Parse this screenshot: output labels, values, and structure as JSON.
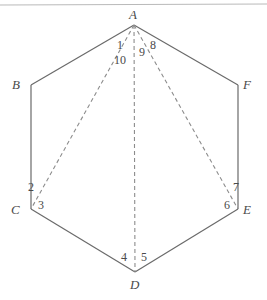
{
  "figure": {
    "shape": "hexagon",
    "colors": {
      "background": "#ffffff",
      "solid_edge": "#6a6a6a",
      "dashed_diagonal": "#8c8c8c",
      "top_rule": "#b9b9b9",
      "label_text": "#4a4a4a"
    },
    "top_rule": {
      "x1": 0,
      "y1": 5,
      "x2": 267,
      "y2": 4
    },
    "vertices": [
      {
        "id": "A",
        "label": "A",
        "x": 134,
        "y": 25,
        "label_x": 129,
        "label_y": 8
      },
      {
        "id": "B",
        "label": "B",
        "x": 31,
        "y": 85,
        "label_x": 12,
        "label_y": 78
      },
      {
        "id": "C",
        "label": "C",
        "x": 31,
        "y": 209,
        "label_x": 11,
        "label_y": 203
      },
      {
        "id": "D",
        "label": "D",
        "x": 135,
        "y": 272,
        "label_x": 130,
        "label_y": 278
      },
      {
        "id": "E",
        "label": "E",
        "x": 238,
        "y": 209,
        "label_x": 243,
        "label_y": 203
      },
      {
        "id": "F",
        "label": "F",
        "x": 238,
        "y": 85,
        "label_x": 243,
        "label_y": 78
      }
    ],
    "edges": [
      {
        "from": "A",
        "to": "B",
        "style": "solid"
      },
      {
        "from": "B",
        "to": "C",
        "style": "solid"
      },
      {
        "from": "C",
        "to": "D",
        "style": "solid"
      },
      {
        "from": "D",
        "to": "E",
        "style": "solid"
      },
      {
        "from": "E",
        "to": "F",
        "style": "solid"
      },
      {
        "from": "F",
        "to": "A",
        "style": "solid"
      }
    ],
    "diagonals": [
      {
        "from": "A",
        "to": "C",
        "style": "dashed"
      },
      {
        "from": "A",
        "to": "D",
        "style": "dashed"
      },
      {
        "from": "A",
        "to": "E",
        "style": "dashed"
      }
    ],
    "angle_labels": [
      {
        "id": "1",
        "text": "1",
        "x": 117,
        "y": 39,
        "at_vertex": "A",
        "between": [
          "AB",
          "AC"
        ]
      },
      {
        "id": "2",
        "text": "2",
        "x": 28,
        "y": 181,
        "at_vertex": "C",
        "between": [
          "CB",
          "CA"
        ]
      },
      {
        "id": "3",
        "text": "3",
        "x": 38,
        "y": 199,
        "at_vertex": "C",
        "between": [
          "CA",
          "CD"
        ]
      },
      {
        "id": "4",
        "text": "4",
        "x": 121,
        "y": 251,
        "at_vertex": "D",
        "between": [
          "DC",
          "DA"
        ]
      },
      {
        "id": "5",
        "text": "5",
        "x": 141,
        "y": 251,
        "at_vertex": "D",
        "between": [
          "DA",
          "DE"
        ]
      },
      {
        "id": "6",
        "text": "6",
        "x": 224,
        "y": 199,
        "at_vertex": "E",
        "between": [
          "ED",
          "EA"
        ]
      },
      {
        "id": "7",
        "text": "7",
        "x": 233,
        "y": 181,
        "at_vertex": "E",
        "between": [
          "EA",
          "EF"
        ]
      },
      {
        "id": "8",
        "text": "8",
        "x": 150,
        "y": 39,
        "at_vertex": "A",
        "between": [
          "AE",
          "AF"
        ]
      },
      {
        "id": "9",
        "text": "9",
        "x": 139,
        "y": 46,
        "at_vertex": "A",
        "between": [
          "AD",
          "AE"
        ]
      },
      {
        "id": "10",
        "text": "10",
        "x": 114,
        "y": 54,
        "at_vertex": "A",
        "between": [
          "AC",
          "AD"
        ]
      }
    ]
  }
}
